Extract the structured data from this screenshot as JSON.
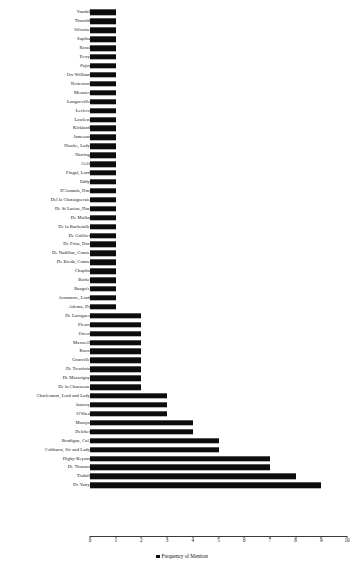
{
  "chart_data": {
    "type": "bar",
    "orientation": "horizontal",
    "title": "",
    "xlabel": "",
    "ylabel": "",
    "xlim": [
      0,
      10
    ],
    "xticks": [
      0,
      1,
      2,
      3,
      4,
      5,
      6,
      7,
      8,
      9,
      10
    ],
    "grid": false,
    "legend": {
      "position": "bottom-center",
      "entries": [
        {
          "label": "Frequency of Mention",
          "color": "#0d0d0d"
        }
      ]
    },
    "series_name": "Frequency of Mention",
    "bar_color": "#0d0d0d",
    "categories": [
      "Vandal",
      "Thorold",
      "Silvaine",
      "Sapiha",
      "Rossi",
      "Perry",
      "Pajot",
      "Orr William",
      "Netterorst",
      "Meunier",
      "Longueville",
      "Leclerc",
      "Lawless",
      "Kirkland",
      "Jameson",
      "Hawke, Lady",
      "Harring",
      "Gelf",
      "Fingal, Lord",
      "Eddy",
      "D'Aumala, Duc",
      "Del la Chataigneraie",
      "De St Lucias, Duc",
      "De Molka",
      "De la Bachetalle",
      "De Gallifet",
      "De Frias, Duc",
      "De Nadillac, Comte",
      "De Breda, Comte",
      "Chaplin",
      "Burke",
      "Baugrée",
      "Avonmore, Lord",
      "Adema, Dr",
      "De Lartigues",
      "Pleurs",
      "Owen",
      "Maxwell",
      "Knox",
      "Granville",
      "De Trentinia",
      "De Macarigny",
      "De la Chausesue",
      "Charlemont, Lord and Lady",
      "Janscry",
      "O'Shea",
      "Mostyn",
      "Delchet",
      "Brodigan, Col.",
      "Colthurst, Sir and Lady",
      "Digby-Beyont",
      "De Thouars",
      "Tisdall",
      "De Vatry"
    ],
    "values": [
      1,
      1,
      1,
      1,
      1,
      1,
      1,
      1,
      1,
      1,
      1,
      1,
      1,
      1,
      1,
      1,
      1,
      1,
      1,
      1,
      1,
      1,
      1,
      1,
      1,
      1,
      1,
      1,
      1,
      1,
      1,
      1,
      1,
      1,
      2,
      2,
      2,
      2,
      2,
      2,
      2,
      2,
      2,
      3,
      3,
      3,
      4,
      4,
      5,
      5,
      7,
      7,
      8,
      9
    ]
  }
}
